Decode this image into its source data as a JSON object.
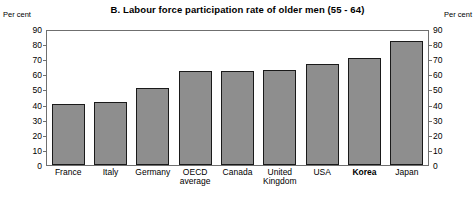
{
  "chart_data": {
    "type": "bar",
    "title": "B.  Labour force participation rate of older men (55 - 64)",
    "xlabel": "",
    "ylabel": "Per cent",
    "unit_label_left": "Per cent",
    "unit_label_right": "Per cent",
    "ylim": [
      0,
      90
    ],
    "ytick_step": 10,
    "yticks": [
      90,
      80,
      70,
      60,
      50,
      40,
      30,
      20,
      10,
      0
    ],
    "ytick_labels": [
      "90",
      "80",
      "70",
      "60",
      "50",
      "40",
      "30",
      "20",
      "10",
      "0"
    ],
    "grid": false,
    "legend": null,
    "dual_axis": true,
    "bar_color": "#8e8e8e",
    "bar_edge_color": "#1a1a1a",
    "frame_color": "#6f6f6f",
    "categories": [
      "France",
      "Italy",
      "Germany",
      "OECD average",
      "Canada",
      "United Kingdom",
      "USA",
      "Korea",
      "Japan"
    ],
    "category_lines": [
      [
        "France"
      ],
      [
        "Italy"
      ],
      [
        "Germany"
      ],
      [
        "OECD",
        "average"
      ],
      [
        "Canada"
      ],
      [
        "United",
        "Kingdom"
      ],
      [
        "USA"
      ],
      [
        "Korea"
      ],
      [
        "Japan"
      ]
    ],
    "emphasized_categories": [
      "Korea"
    ],
    "values": [
      41,
      42,
      52,
      63,
      63,
      64,
      68,
      72,
      83
    ]
  }
}
